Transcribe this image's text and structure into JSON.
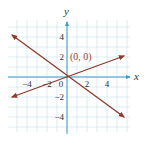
{
  "chart_data": {
    "type": "line",
    "title": "",
    "xlabel": "x",
    "ylabel": "y",
    "xlim": [
      -6,
      6
    ],
    "ylim": [
      -5.5,
      5.5
    ],
    "grid": true,
    "x_ticks": [
      -4,
      -2,
      0,
      2,
      4
    ],
    "x_tick_labels": [
      "−4",
      "−2",
      "0",
      "2",
      "4"
    ],
    "y_ticks": [
      4,
      2,
      -2,
      -4
    ],
    "y_tick_labels": [
      "4",
      "2",
      "−2",
      "−4"
    ],
    "series": [
      {
        "name": "line-decreasing",
        "x": [
          -5.5,
          5.7
        ],
        "y": [
          4.2,
          -4.0
        ],
        "arrows": "both"
      },
      {
        "name": "line-increasing",
        "x": [
          -5.5,
          5.7
        ],
        "y": [
          -2.0,
          2.1
        ],
        "arrows": "both"
      }
    ],
    "annotations": [
      {
        "text": "(0, 0)",
        "x": 0,
        "y": 0
      }
    ]
  },
  "colors": {
    "line": "#8e3b2a",
    "axis": "#3a9ec4",
    "grid": "#d3e8f0",
    "annotation": "#a0432c"
  }
}
